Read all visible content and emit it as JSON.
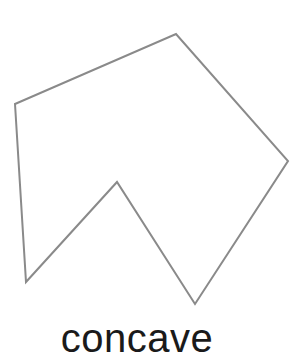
{
  "diagram": {
    "label": "concave",
    "shape": {
      "type": "polygon",
      "kind": "concave",
      "points": [
        [
          15,
          104
        ],
        [
          176,
          34
        ],
        [
          288,
          161
        ],
        [
          195,
          304
        ],
        [
          117,
          182
        ],
        [
          26,
          282
        ]
      ],
      "stroke_color": "#8a8a8a",
      "stroke_width": 2,
      "fill": "none"
    },
    "colors": {
      "background": "#ffffff",
      "text": "#1a1a1a"
    }
  }
}
